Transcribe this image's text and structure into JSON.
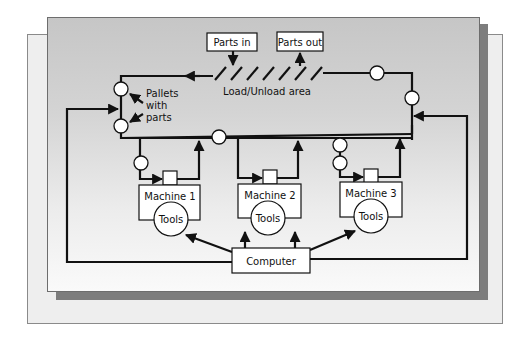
{
  "diagram": {
    "labels": {
      "parts_in": "Parts in",
      "parts_out": "Parts out",
      "load_unload": "Load/Unload area",
      "pallets_line1": "Pallets",
      "pallets_line2": "with",
      "pallets_line3": "parts",
      "computer": "Computer"
    },
    "machines": [
      {
        "name": "Machine 1",
        "tools": "Tools"
      },
      {
        "name": "Machine 2",
        "tools": "Tools"
      },
      {
        "name": "Machine 3",
        "tools": "Tools"
      }
    ],
    "colors": {
      "line": "#111111",
      "panel_top": "#c6c6c6",
      "panel_bottom": "#fafafa",
      "shadow": "#7d7d7d",
      "back_panel": "#eeeeee"
    }
  }
}
